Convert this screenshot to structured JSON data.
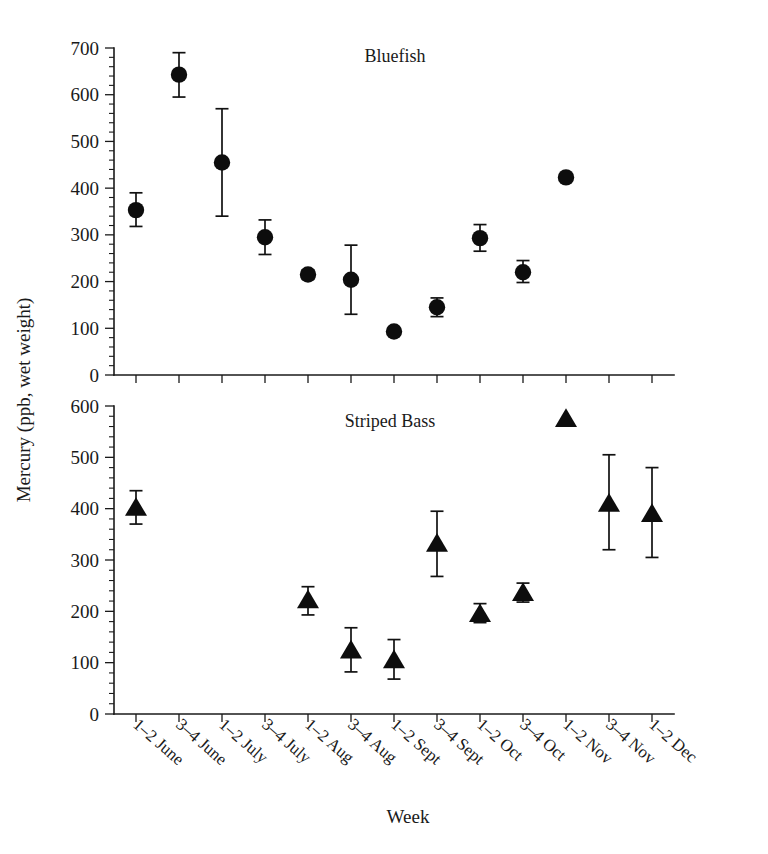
{
  "figure": {
    "y_axis_title": "Mercury (ppb, wet weight)",
    "x_axis_title": "Week"
  },
  "panels": {
    "top": {
      "title": "Bluefish"
    },
    "bottom": {
      "title": "Striped Bass"
    }
  },
  "chart_data": [
    {
      "type": "scatter",
      "title": "Bluefish",
      "xlabel": "Week",
      "ylabel": "Mercury (ppb, wet weight)",
      "ylim": [
        0,
        700
      ],
      "yticks": [
        0,
        100,
        200,
        300,
        400,
        500,
        600,
        700
      ],
      "ytick_labels": [
        "0",
        "100",
        "200",
        "300",
        "400",
        "500",
        "600",
        "700"
      ],
      "grid": false,
      "legend": "none",
      "marker": "filled-circle",
      "error_bars": "vertical, capped",
      "categories": [
        "1–2 June",
        "3–4 June",
        "1–2 July",
        "3–4 July",
        "1–2 Aug",
        "3–4 Aug",
        "1–2 Sept",
        "3–4 Sept",
        "1–2 Oct",
        "3–4 Oct",
        "1–2 Nov",
        "3–4 Nov",
        "1–2 Dec"
      ],
      "points": [
        {
          "category": "1–2 June",
          "value": 353,
          "err_low": 318,
          "err_high": 390
        },
        {
          "category": "3–4 June",
          "value": 643,
          "err_low": 595,
          "err_high": 690
        },
        {
          "category": "1–2 July",
          "value": 455,
          "err_low": 340,
          "err_high": 570
        },
        {
          "category": "3–4 July",
          "value": 295,
          "err_low": 258,
          "err_high": 332
        },
        {
          "category": "1–2 Aug",
          "value": 215,
          "err_low": 205,
          "err_high": 225
        },
        {
          "category": "3–4 Aug",
          "value": 204,
          "err_low": 130,
          "err_high": 278
        },
        {
          "category": "1–2 Sept",
          "value": 93,
          "err_low": null,
          "err_high": null
        },
        {
          "category": "3–4 Sept",
          "value": 145,
          "err_low": 125,
          "err_high": 165
        },
        {
          "category": "1–2 Oct",
          "value": 293,
          "err_low": 265,
          "err_high": 322
        },
        {
          "category": "3–4 Oct",
          "value": 220,
          "err_low": 198,
          "err_high": 245
        },
        {
          "category": "1–2 Nov",
          "value": 423,
          "err_low": null,
          "err_high": null
        },
        {
          "category": "3–4 Nov",
          "value": null,
          "err_low": null,
          "err_high": null
        },
        {
          "category": "1–2 Dec",
          "value": null,
          "err_low": null,
          "err_high": null
        }
      ]
    },
    {
      "type": "scatter",
      "title": "Striped Bass",
      "xlabel": "Week",
      "ylabel": "Mercury (ppb, wet weight)",
      "ylim": [
        0,
        600
      ],
      "yticks": [
        0,
        100,
        200,
        300,
        400,
        500,
        600
      ],
      "ytick_labels": [
        "0",
        "100",
        "200",
        "300",
        "400",
        "500",
        "600"
      ],
      "grid": false,
      "legend": "none",
      "marker": "filled-triangle",
      "error_bars": "vertical, capped",
      "categories": [
        "1–2 June",
        "3–4 June",
        "1–2 July",
        "3–4 July",
        "1–2 Aug",
        "3–4 Aug",
        "1–2 Sept",
        "3–4 Sept",
        "1–2 Oct",
        "3–4 Oct",
        "1–2 Nov",
        "3–4 Nov",
        "1–2 Dec"
      ],
      "points": [
        {
          "category": "1–2 June",
          "value": 402,
          "err_low": 370,
          "err_high": 435
        },
        {
          "category": "3–4 June",
          "value": null,
          "err_low": null,
          "err_high": null
        },
        {
          "category": "1–2 July",
          "value": null,
          "err_low": null,
          "err_high": null
        },
        {
          "category": "3–4 July",
          "value": null,
          "err_low": null,
          "err_high": null
        },
        {
          "category": "1–2 Aug",
          "value": 222,
          "err_low": 193,
          "err_high": 248
        },
        {
          "category": "3–4 Aug",
          "value": 124,
          "err_low": 82,
          "err_high": 168
        },
        {
          "category": "1–2 Sept",
          "value": 105,
          "err_low": 68,
          "err_high": 145
        },
        {
          "category": "3–4 Sept",
          "value": 332,
          "err_low": 268,
          "err_high": 395
        },
        {
          "category": "1–2 Oct",
          "value": 195,
          "err_low": 178,
          "err_high": 215
        },
        {
          "category": "3–4 Oct",
          "value": 236,
          "err_low": 218,
          "err_high": 255
        },
        {
          "category": "1–2 Nov",
          "value": 575,
          "err_low": null,
          "err_high": null
        },
        {
          "category": "3–4 Nov",
          "value": 410,
          "err_low": 320,
          "err_high": 505
        },
        {
          "category": "1–2 Dec",
          "value": 390,
          "err_low": 305,
          "err_high": 480
        }
      ]
    }
  ],
  "colors": {
    "marker": "#0d0d0d",
    "axis": "#1a1a1a",
    "background": "#ffffff"
  }
}
